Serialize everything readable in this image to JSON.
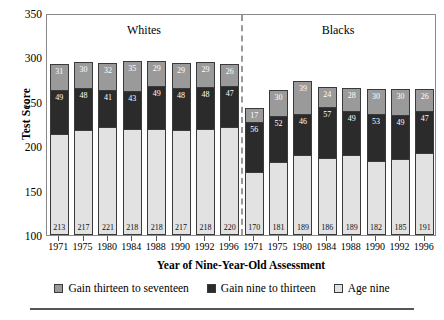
{
  "chart_data": {
    "type": "bar",
    "subtype": "stacked",
    "title": "",
    "xlabel": "Year of Nine-Year-Old Assessment",
    "ylabel": "Test Score",
    "ylim": [
      100,
      350
    ],
    "yticks": [
      100,
      150,
      200,
      250,
      300,
      350
    ],
    "grid": false,
    "legend_position": "bottom",
    "groups": [
      {
        "name": "Whites"
      },
      {
        "name": "Blacks"
      }
    ],
    "categories": [
      "1971",
      "1975",
      "1980",
      "1984",
      "1988",
      "1990",
      "1992",
      "1996",
      "1971",
      "1975",
      "1980",
      "1984",
      "1988",
      "1990",
      "1992",
      "1996"
    ],
    "series": [
      {
        "name": "Age nine",
        "color": "#e2e2e2",
        "values": [
          213,
          217,
          221,
          218,
          218,
          217,
          218,
          220,
          170,
          181,
          189,
          186,
          189,
          182,
          185,
          191
        ]
      },
      {
        "name": "Gain nine to thirteen",
        "color": "#2b2b2b",
        "values": [
          49,
          48,
          41,
          43,
          49,
          48,
          48,
          47,
          56,
          52,
          46,
          57,
          49,
          53,
          49,
          47
        ]
      },
      {
        "name": "Gain thirteen to seventeen",
        "color": "#9a9a9a",
        "values": [
          31,
          30,
          32,
          35,
          29,
          29,
          29,
          26,
          17,
          30,
          39,
          24,
          28,
          30,
          30,
          26
        ]
      }
    ],
    "bars": [
      {
        "group": "Whites",
        "year": "1971",
        "base": 213,
        "middle": 49,
        "top": 31,
        "total": 293
      },
      {
        "group": "Whites",
        "year": "1975",
        "base": 217,
        "middle": 48,
        "top": 30,
        "total": 295
      },
      {
        "group": "Whites",
        "year": "1980",
        "base": 221,
        "middle": 41,
        "top": 32,
        "total": 294
      },
      {
        "group": "Whites",
        "year": "1984",
        "base": 218,
        "middle": 43,
        "top": 35,
        "total": 296
      },
      {
        "group": "Whites",
        "year": "1988",
        "base": 218,
        "middle": 49,
        "top": 29,
        "total": 296
      },
      {
        "group": "Whites",
        "year": "1990",
        "base": 217,
        "middle": 48,
        "top": 29,
        "total": 294
      },
      {
        "group": "Whites",
        "year": "1992",
        "base": 218,
        "middle": 48,
        "top": 29,
        "total": 295
      },
      {
        "group": "Whites",
        "year": "1996",
        "base": 220,
        "middle": 47,
        "top": 26,
        "total": 293
      },
      {
        "group": "Blacks",
        "year": "1971",
        "base": 170,
        "middle": 56,
        "top": 17,
        "total": 243
      },
      {
        "group": "Blacks",
        "year": "1975",
        "base": 181,
        "middle": 52,
        "top": 30,
        "total": 263
      },
      {
        "group": "Blacks",
        "year": "1980",
        "base": 189,
        "middle": 46,
        "top": 39,
        "total": 274
      },
      {
        "group": "Blacks",
        "year": "1984",
        "base": 186,
        "middle": 57,
        "top": 24,
        "total": 267
      },
      {
        "group": "Blacks",
        "year": "1988",
        "base": 189,
        "middle": 49,
        "top": 28,
        "total": 266
      },
      {
        "group": "Blacks",
        "year": "1990",
        "base": 182,
        "middle": 53,
        "top": 30,
        "total": 265
      },
      {
        "group": "Blacks",
        "year": "1992",
        "base": 185,
        "middle": 49,
        "top": 30,
        "total": 264
      },
      {
        "group": "Blacks",
        "year": "1996",
        "base": 191,
        "middle": 47,
        "top": 26,
        "total": 264
      }
    ],
    "legend": [
      {
        "label": "Gain thirteen to seventeen",
        "color": "#9a9a9a"
      },
      {
        "label": "Gain nine to thirteen",
        "color": "#2b2b2b"
      },
      {
        "label": "Age nine",
        "color": "#e2e2e2"
      }
    ]
  }
}
